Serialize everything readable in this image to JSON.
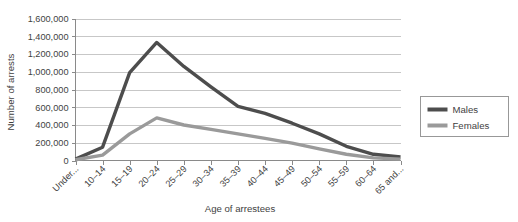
{
  "chart_data": {
    "type": "line",
    "title": "",
    "xlabel": "Age of arrestees",
    "ylabel": "Number of arrests",
    "categories": [
      "Under...",
      "10–14",
      "15–19",
      "20–24",
      "25–29",
      "30–34",
      "35–39",
      "40–44",
      "45–49",
      "50–54",
      "55–59",
      "60–64",
      "65 and..."
    ],
    "ytick_labels": [
      "0",
      "200,000",
      "400,000",
      "600,000",
      "800,000",
      "1,000,000",
      "1,200,000",
      "1,400,000",
      "1,600,000"
    ],
    "ytick_values": [
      0,
      200000,
      400000,
      600000,
      800000,
      1000000,
      1200000,
      1400000,
      1600000
    ],
    "ylim": [
      0,
      1600000
    ],
    "grid": "horizontal",
    "legend_position": "right",
    "series": [
      {
        "name": "Males",
        "color": "#4d4d4d",
        "values": [
          15000,
          150000,
          990000,
          1330000,
          1060000,
          830000,
          610000,
          530000,
          420000,
          300000,
          160000,
          70000,
          40000
        ]
      },
      {
        "name": "Females",
        "color": "#9a9a9a",
        "values": [
          8000,
          60000,
          300000,
          480000,
          400000,
          350000,
          300000,
          250000,
          195000,
          130000,
          70000,
          30000,
          15000
        ]
      }
    ]
  },
  "legend": {
    "items": [
      {
        "label": "Males"
      },
      {
        "label": "Females"
      }
    ]
  },
  "axes": {
    "y_title": "Number of arrests",
    "x_title": "Age of arrestees"
  }
}
